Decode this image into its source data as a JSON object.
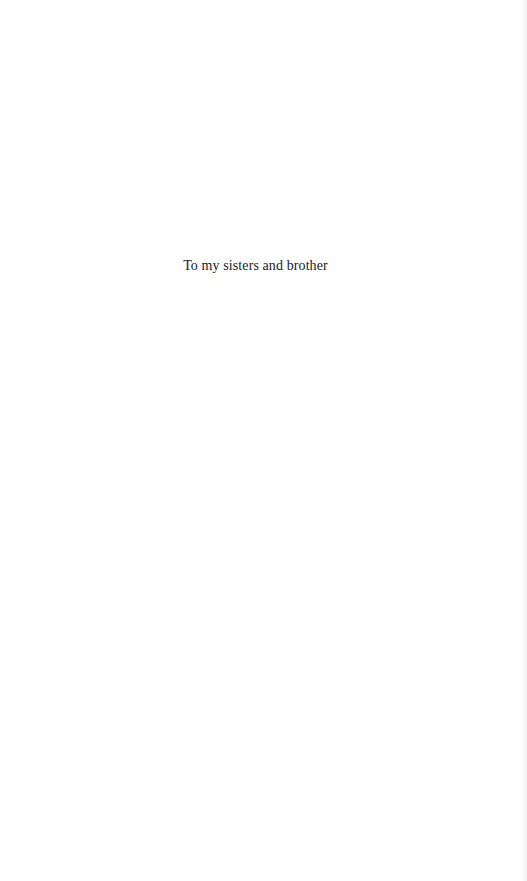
{
  "page": {
    "dedication": "To my sisters and brother"
  }
}
